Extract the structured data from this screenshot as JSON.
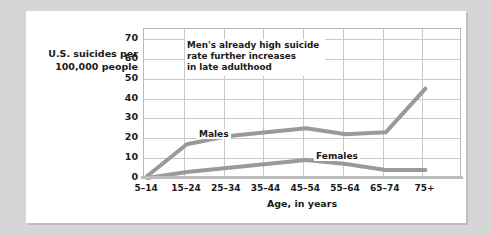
{
  "figure": {
    "y_axis_caption_line1": "U.S. suicides per",
    "y_axis_caption_line2": "100,000 people",
    "x_axis_title": "Age, in years",
    "annotation_line1": "Men's already high suicide",
    "annotation_line2": "rate further increases",
    "annotation_line3": "in late adulthood",
    "series_label_males": "Males",
    "series_label_females": "Females",
    "line_color": "#9a9a9a",
    "grid_color": "#c9c9c9",
    "card_color": "#ffffff",
    "page_background": "#d6d6d6"
  },
  "chart_data": {
    "type": "line",
    "title": "",
    "xlabel": "Age, in years",
    "ylabel": "U.S. suicides per 100,000 people",
    "categories": [
      "5–14",
      "15–24",
      "25–34",
      "35–44",
      "45–54",
      "55–64",
      "65–74",
      "75+"
    ],
    "ylim": [
      0,
      75
    ],
    "yticks": [
      0,
      10,
      20,
      30,
      40,
      50,
      60,
      70
    ],
    "ytick_labels": [
      "0",
      "10",
      "20",
      "30",
      "40",
      "50",
      "60",
      "70"
    ],
    "grid": true,
    "legend": "inline-labels",
    "series": [
      {
        "name": "Males",
        "values": [
          1,
          17,
          21,
          23,
          25,
          22,
          23,
          45
        ]
      },
      {
        "name": "Females",
        "values": [
          0,
          3,
          5,
          7,
          9,
          7,
          4,
          4
        ]
      }
    ],
    "annotations": [
      {
        "text": "Men's already high suicide rate further increases in late adulthood",
        "at": "45–54"
      }
    ]
  }
}
